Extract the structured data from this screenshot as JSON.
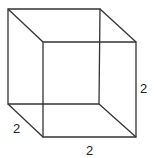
{
  "diagram": {
    "type": "wireframe-cube",
    "vertices": {
      "back_top_left": [
        8,
        9
      ],
      "back_top_right": [
        100,
        9
      ],
      "back_bottom_left": [
        8,
        104
      ],
      "back_bottom_right": [
        99,
        104
      ],
      "front_top_left": [
        43,
        42
      ],
      "front_top_right": [
        136,
        42
      ],
      "front_bottom_left": [
        43,
        137
      ],
      "front_bottom_right": [
        136,
        137
      ]
    },
    "labels": {
      "depth": "2",
      "width": "2",
      "height": "2"
    },
    "colors": {
      "stroke": "#333333",
      "background": "#ffffff"
    }
  }
}
